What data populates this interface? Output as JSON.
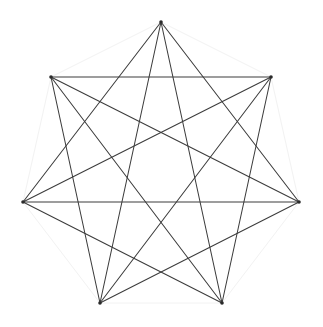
{
  "figure": {
    "type": "graph-drawing",
    "background_color": "#ffffff",
    "canvas": {
      "width": 323,
      "height": 327
    }
  },
  "chart_data": {
    "type": "scatter",
    "xlabel": "",
    "ylabel": "",
    "grid": false,
    "legend": "none",
    "xlim": [
      0,
      323
    ],
    "ylim": [
      0,
      327
    ],
    "graph_name": "K7",
    "vertex_count": 7,
    "edge_count": 21,
    "nodes": [
      {
        "id": 0,
        "label": "v0",
        "x": 161,
        "y": 22
      },
      {
        "id": 1,
        "label": "v1",
        "x": 271,
        "y": 77
      },
      {
        "id": 2,
        "label": "v2",
        "x": 299,
        "y": 202
      },
      {
        "id": 3,
        "label": "v3",
        "x": 222,
        "y": 303
      },
      {
        "id": 4,
        "label": "v4",
        "x": 100,
        "y": 303
      },
      {
        "id": 5,
        "label": "v5",
        "x": 23,
        "y": 202
      },
      {
        "id": 6,
        "label": "v6",
        "x": 51,
        "y": 77
      }
    ],
    "edges_perimeter": [
      [
        0,
        1
      ],
      [
        1,
        2
      ],
      [
        2,
        3
      ],
      [
        3,
        4
      ],
      [
        4,
        5
      ],
      [
        5,
        6
      ],
      [
        6,
        0
      ]
    ],
    "edges_diagonal": [
      [
        0,
        2
      ],
      [
        0,
        3
      ],
      [
        0,
        4
      ],
      [
        0,
        5
      ],
      [
        1,
        3
      ],
      [
        1,
        4
      ],
      [
        1,
        5
      ],
      [
        1,
        6
      ],
      [
        2,
        4
      ],
      [
        2,
        5
      ],
      [
        2,
        6
      ],
      [
        3,
        5
      ],
      [
        3,
        6
      ],
      [
        4,
        6
      ]
    ],
    "colors": {
      "perimeter_edge": "#f2f2f2",
      "diagonal_edge": "#3c3c3c",
      "vertex": "#2a2a2a",
      "background": "#ffffff"
    },
    "vertex_radius": 1.8,
    "perimeter_stroke_width": 1,
    "diagonal_stroke_width": 1.05
  }
}
